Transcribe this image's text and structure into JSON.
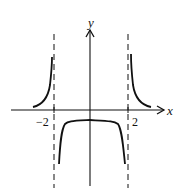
{
  "figure": {
    "type": "function-graph",
    "x_axis_label": "x",
    "y_axis_label": "y",
    "tick_labels": [
      "−2",
      "2"
    ],
    "vertical_asymptotes": [
      -2,
      2
    ],
    "line_color": "#111111",
    "background": "#ffffff"
  }
}
